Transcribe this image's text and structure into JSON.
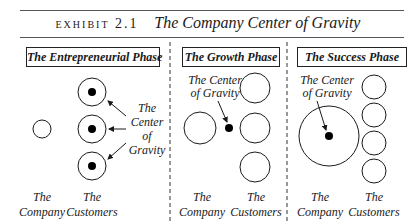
{
  "exhibit": {
    "label": "EXHIBIT 2.1",
    "title": "The Company Center of Gravity"
  },
  "phases": [
    {
      "title": "The Entrepreneurial Phase",
      "company_label_1": "The",
      "company_label_2": "Company",
      "customers_label_1": "The",
      "customers_label_2": "Customers",
      "annotation": [
        "The",
        "Center",
        "of",
        "Gravity"
      ]
    },
    {
      "title": "The Growth Phase",
      "company_label_1": "The",
      "company_label_2": "Company",
      "customers_label_1": "The",
      "customers_label_2": "Customers",
      "annotation": [
        "The Center",
        "of Gravity"
      ]
    },
    {
      "title": "The Success Phase",
      "company_label_1": "The",
      "company_label_2": "Company",
      "customers_label_1": "The",
      "customers_label_2": "Customers",
      "annotation": [
        "The Center",
        "of Gravity"
      ]
    }
  ]
}
